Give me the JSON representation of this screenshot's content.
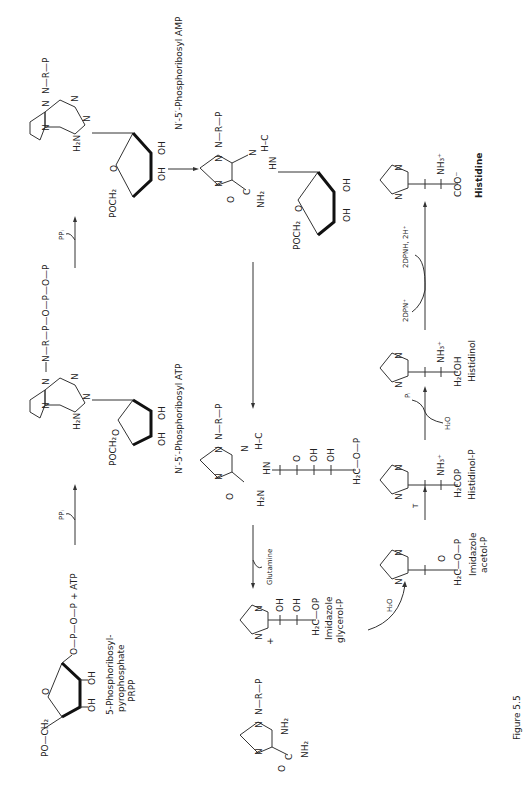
{
  "figure": {
    "caption": "Figure 5.5",
    "orientation": "rotated 90° counter-clockwise",
    "compounds": {
      "prpp": {
        "name_line1": "5-Phosphoribosyl-",
        "name_line2": "pyrophosphate",
        "name_line3": "PRPP",
        "chain": "O—P—O—P + ATP",
        "po": "PO—CH₂",
        "oh": "OH"
      },
      "atp": {
        "name": "N′-5′-Phosphoribosyl ATP",
        "chain": "N—R—P—O—P—O—P",
        "amine": "H₂N",
        "poch": "POCH₂",
        "oh": "OH"
      },
      "amp": {
        "name": "N′-5′-Phosphoribosyl AMP",
        "chain": "N—R—P",
        "amine": "H₂N",
        "poch": "POCH₂",
        "oh": "OH"
      },
      "intermediate_top": {
        "nr": "N—R—P",
        "hc": "H–C",
        "hn": "HN",
        "nh2": "NH₂",
        "o": "O",
        "c": "C",
        "poch": "POCH₂",
        "oh": "OH"
      },
      "intermediate_mid": {
        "nr": "N—R—P",
        "hn": "HN",
        "hc": "H–C",
        "h2n": "H₂N",
        "o": "O",
        "oh": "OH",
        "h2c": "H₂C—O—P"
      },
      "aicar": {
        "nr": "N—R—P",
        "nh2": "NH₂",
        "c": "C",
        "o": "O"
      },
      "imidazole_glycerol_p": {
        "name_line1": "Imidazole",
        "name_line2": "glycerol-P",
        "oh": "OH",
        "h2c": "H₂C—OP"
      },
      "imidazole_acetol_p": {
        "name_line1": "Imidazole",
        "name_line2": "acetol-P",
        "o": "O",
        "h2c": "H₂C—O—P"
      },
      "histidinol_p": {
        "name": "Histidinol-P",
        "nh3": "NH₃⁺",
        "h2cop": "H₂COP"
      },
      "histidinol": {
        "name": "Histidinol",
        "nh3": "NH₃⁺",
        "h2coh": "H₂COH"
      },
      "histidine": {
        "name": "Histidine",
        "nh3": "NH₃⁺",
        "coo": "COO⁻"
      }
    },
    "reagents": {
      "ppi_1": "PPᵢ",
      "ppi_2": "PPᵢ",
      "glutamine": "Glutamine",
      "plus": "+",
      "h2o_1": "H₂O",
      "t": "T",
      "h2o_2": "H₂O",
      "pi": "Pᵢ",
      "dpn": "2DPN⁺",
      "dpnh": "2DPNH, 2H⁺"
    },
    "ring_atoms": {
      "n": "N"
    }
  }
}
